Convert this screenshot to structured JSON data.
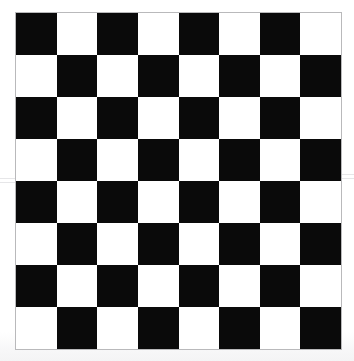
{
  "image": {
    "subject": "checkerboard",
    "description": "Scanned black and white 8x8 checkerboard pattern",
    "background_color": "#fdfdfd",
    "width": 354,
    "height": 361
  },
  "board": {
    "rows": 8,
    "columns": 8,
    "left": 15,
    "top": 12,
    "width": 327,
    "height": 338,
    "cell_width": 40.875,
    "cell_height": 42.25,
    "border_color": "#b9b9bb",
    "dark_color": "#0a0a0a",
    "light_color": "#ffffff",
    "top_left_cell": "dark",
    "top_right_cell": "light",
    "bottom_left_cell": "light",
    "bottom_right_cell": "dark",
    "pattern": [
      [
        "dark",
        "light",
        "dark",
        "light",
        "dark",
        "light",
        "dark",
        "light"
      ],
      [
        "light",
        "dark",
        "light",
        "dark",
        "light",
        "dark",
        "light",
        "dark"
      ],
      [
        "dark",
        "light",
        "dark",
        "light",
        "dark",
        "light",
        "dark",
        "light"
      ],
      [
        "light",
        "dark",
        "light",
        "dark",
        "light",
        "dark",
        "light",
        "dark"
      ],
      [
        "dark",
        "light",
        "dark",
        "light",
        "dark",
        "light",
        "dark",
        "light"
      ],
      [
        "light",
        "dark",
        "light",
        "dark",
        "light",
        "dark",
        "light",
        "dark"
      ],
      [
        "dark",
        "light",
        "dark",
        "light",
        "dark",
        "light",
        "dark",
        "light"
      ],
      [
        "light",
        "dark",
        "light",
        "dark",
        "light",
        "dark",
        "light",
        "dark"
      ]
    ]
  },
  "artifacts": {
    "scan_seam_y": 178,
    "scan_seam_color": "#e2e2e4"
  }
}
